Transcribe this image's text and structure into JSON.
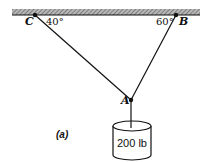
{
  "diagram": {
    "type": "statics-free-body",
    "caption": "(a)",
    "ceiling": {
      "x1": 12,
      "x2": 200,
      "y_top": 9,
      "y_bottom": 15
    },
    "nodes": {
      "C": {
        "label": "C",
        "x": 35,
        "y": 15
      },
      "B": {
        "label": "B",
        "x": 176,
        "y": 15
      },
      "A": {
        "label": "A",
        "x": 131,
        "y": 100
      }
    },
    "angles": {
      "C": "40°",
      "B": "60°"
    },
    "cables": [
      {
        "from": "C",
        "to": "A"
      },
      {
        "from": "B",
        "to": "A"
      },
      {
        "from": "A",
        "to": "weight"
      }
    ],
    "weight": {
      "label": "200 lb",
      "shape": "cylinder"
    }
  }
}
